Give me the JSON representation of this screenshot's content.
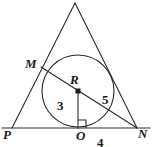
{
  "figure": {
    "kind": "geometry-diagram",
    "width": 154,
    "height": 147,
    "stroke_color": "#2b2b2b",
    "label_color": "#1a1a1a",
    "background_color": "#ffffff"
  },
  "points": {
    "apex": {
      "label": "",
      "x": 75,
      "y": 3
    },
    "M": {
      "label": "M",
      "x": 45,
      "y": 70
    },
    "R": {
      "label": "R",
      "x": 78,
      "y": 91
    },
    "P": {
      "label": "P",
      "x": 12,
      "y": 128
    },
    "O": {
      "label": "O",
      "x": 81,
      "y": 128
    },
    "N": {
      "label": "N",
      "x": 137,
      "y": 128
    }
  },
  "circle": {
    "name": "inscribed-circle",
    "center_x": 78,
    "center_y": 91,
    "radius": 36
  },
  "segments": [
    {
      "name": "side-apex-P",
      "from": "apex",
      "to": "P"
    },
    {
      "name": "side-apex-N",
      "from": "apex",
      "to": "N"
    },
    {
      "name": "base-PN",
      "from": "P",
      "to": "N"
    },
    {
      "name": "chord-M-N",
      "from": "M",
      "to": "N"
    },
    {
      "name": "radius-R-O",
      "from": "R",
      "to": "O"
    }
  ],
  "measure_labels": {
    "radius_RO": "3",
    "segment_RN": "5",
    "segment_ON": "4"
  },
  "markers": {
    "right_angle_at_O": true,
    "center_dot_at_R": true
  }
}
